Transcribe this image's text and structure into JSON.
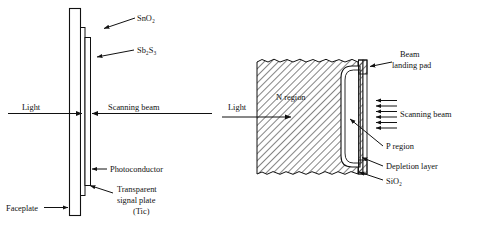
{
  "figure": {
    "title": "",
    "background": "#ffffff",
    "ink": "#111111",
    "hatch_color": "#3a3a3a"
  },
  "left_diagram": {
    "name": "vidicon-faceplate-cross-section",
    "labels": {
      "sno2": "SnO₂",
      "sb2s3": "Sb₂S₃",
      "light": "Light",
      "scanning_beam": "Scanning beam",
      "photoconductor": "Photoconductor",
      "transparent_line1": "Transparent",
      "transparent_line2": "signal plate",
      "transparent_line3": "(Tic)",
      "faceplate": "Faceplate"
    }
  },
  "right_diagram": {
    "name": "silicon-diode-array-cross-section",
    "labels": {
      "beam_line1": "Beam",
      "beam_line2": "landing pad",
      "n_region": "N region",
      "light": "Light",
      "scanning_beam": "Scanning beam",
      "p_region": "P region",
      "depletion_layer": "Depletion layer",
      "sio2": "SiO₂"
    },
    "scanning_beam_arrow_count": 6
  }
}
